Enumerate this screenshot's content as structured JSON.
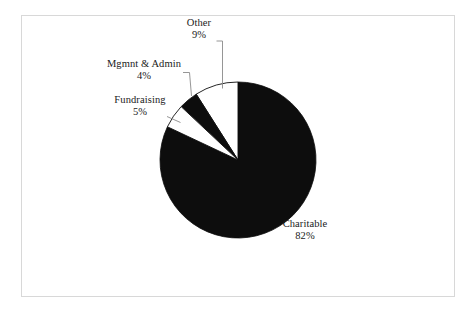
{
  "chart_data": {
    "type": "pie",
    "title": "",
    "subtitle": "",
    "xlabel": "",
    "ylabel": "",
    "legend_position": "none",
    "grid": false,
    "labels_show_percent": true,
    "start_angle_deg": 90,
    "direction": "counterclockwise",
    "categories": [
      "Other",
      "Mgmnt & Admin",
      "Fundraising",
      "Charitable"
    ],
    "values": [
      9,
      4,
      5,
      82
    ],
    "value_labels": [
      "9%",
      "4%",
      "5%",
      "82%"
    ],
    "colors": [
      "#ffffff",
      "#0d0d0d",
      "#ffffff",
      "#0d0d0d"
    ],
    "slices": [
      {
        "name": "Other",
        "value": 9,
        "value_label": "9%",
        "color": "#ffffff",
        "leader_line": true
      },
      {
        "name": "Mgmnt & Admin",
        "value": 4,
        "value_label": "4%",
        "color": "#0d0d0d",
        "leader_line": true
      },
      {
        "name": "Fundraising",
        "value": 5,
        "value_label": "5%",
        "color": "#ffffff",
        "leader_line": true
      },
      {
        "name": "Charitable",
        "value": 82,
        "value_label": "82%",
        "color": "#0d0d0d",
        "leader_line": false
      }
    ]
  },
  "figure": {
    "border_color": "#d8d8d8",
    "background": "#ffffff",
    "outline_color": "#0d0d0d",
    "text_color": "#1a1a1a"
  },
  "labels": {
    "other": {
      "name": "Other",
      "percent": "9%"
    },
    "mgmnt": {
      "name": "Mgmnt & Admin",
      "percent": "4%"
    },
    "fundraising": {
      "name": "Fundraising",
      "percent": "5%"
    },
    "charitable": {
      "name": "Charitable",
      "percent": "82%"
    }
  }
}
